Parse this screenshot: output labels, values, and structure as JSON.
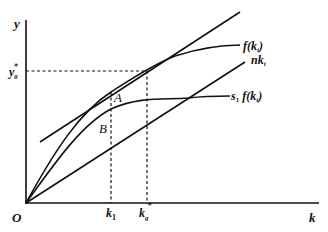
{
  "diagram": {
    "type": "economic-growth-diagram",
    "axes": {
      "y_label": "y",
      "x_label": "k",
      "origin_label": "O"
    },
    "curves": [
      {
        "id": "f",
        "label": "f(k_t)",
        "label_main": "f(k",
        "label_sub": "t",
        "label_end": ")",
        "kind": "concave-curve"
      },
      {
        "id": "nk",
        "label": "nk_t",
        "label_main": "nk",
        "label_sub": "t",
        "kind": "ray"
      },
      {
        "id": "s1f",
        "label": "s_1 f(k_t)",
        "label_pre": "s",
        "label_pre_sub": "1",
        "label_main": " f(k",
        "label_sub": "t",
        "label_end": ")",
        "kind": "concave-curve"
      },
      {
        "id": "tangent",
        "label": "",
        "kind": "tangent-line"
      }
    ],
    "points": [
      {
        "id": "A",
        "label": "A"
      },
      {
        "id": "B",
        "label": "B"
      }
    ],
    "reference_lines": {
      "y_level": {
        "label_main": "y",
        "label_sub": "g",
        "label_sup": "*"
      },
      "k1": {
        "label_main": "k",
        "label_sub": "1"
      },
      "kg": {
        "label_main": "k",
        "label_sub": "g",
        "label_sup": "*"
      }
    },
    "colors": {
      "ink": "#111111",
      "background": "#ffffff"
    }
  }
}
